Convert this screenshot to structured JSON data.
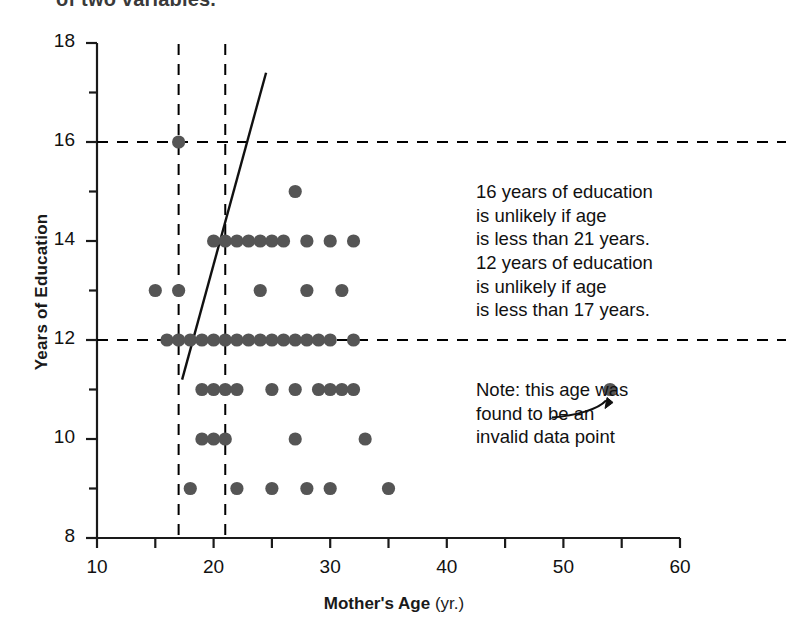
{
  "page": {
    "clipped_top_text": "of two variables."
  },
  "axes": {
    "ylabel": "Years of Education",
    "xlabel_bold": "Mother's Age",
    "xlabel_unit": "(yr.)",
    "x_ticks": [
      10,
      20,
      30,
      40,
      50,
      60
    ],
    "y_ticks": [
      8,
      10,
      12,
      14,
      16,
      18
    ],
    "x_minor_step": 5,
    "y_minor_step": 1
  },
  "annotations": {
    "stats": "16 years of education\nis unlikely if age\nis less than 21 years.\n12 years of education\nis unlikely if age\nis less than 17 years.",
    "note": "Note: this age was\nfound to be an\ninvalid data point"
  },
  "colors": {
    "dot": "#555555",
    "axis": "#1a1a1a",
    "guide": "#000000",
    "text": "#111111"
  },
  "chart_data": {
    "type": "scatter",
    "title": "",
    "xlabel": "Mother's Age (yr.)",
    "ylabel": "Years of Education",
    "xlim": [
      10,
      60
    ],
    "ylim": [
      8,
      18
    ],
    "grid": false,
    "legend": null,
    "points": [
      {
        "x": 17,
        "y": 16
      },
      {
        "x": 27,
        "y": 15
      },
      {
        "x": 20,
        "y": 14
      },
      {
        "x": 21,
        "y": 14
      },
      {
        "x": 22,
        "y": 14
      },
      {
        "x": 23,
        "y": 14
      },
      {
        "x": 24,
        "y": 14
      },
      {
        "x": 25,
        "y": 14
      },
      {
        "x": 26,
        "y": 14
      },
      {
        "x": 28,
        "y": 14
      },
      {
        "x": 30,
        "y": 14
      },
      {
        "x": 32,
        "y": 14
      },
      {
        "x": 15,
        "y": 13
      },
      {
        "x": 17,
        "y": 13
      },
      {
        "x": 24,
        "y": 13
      },
      {
        "x": 28,
        "y": 13
      },
      {
        "x": 31,
        "y": 13
      },
      {
        "x": 16,
        "y": 12
      },
      {
        "x": 17,
        "y": 12
      },
      {
        "x": 18,
        "y": 12
      },
      {
        "x": 19,
        "y": 12
      },
      {
        "x": 20,
        "y": 12
      },
      {
        "x": 21,
        "y": 12
      },
      {
        "x": 22,
        "y": 12
      },
      {
        "x": 23,
        "y": 12
      },
      {
        "x": 24,
        "y": 12
      },
      {
        "x": 25,
        "y": 12
      },
      {
        "x": 26,
        "y": 12
      },
      {
        "x": 27,
        "y": 12
      },
      {
        "x": 28,
        "y": 12
      },
      {
        "x": 29,
        "y": 12
      },
      {
        "x": 30,
        "y": 12
      },
      {
        "x": 32,
        "y": 12
      },
      {
        "x": 19,
        "y": 11
      },
      {
        "x": 20,
        "y": 11
      },
      {
        "x": 21,
        "y": 11
      },
      {
        "x": 22,
        "y": 11
      },
      {
        "x": 25,
        "y": 11
      },
      {
        "x": 27,
        "y": 11
      },
      {
        "x": 29,
        "y": 11
      },
      {
        "x": 30,
        "y": 11
      },
      {
        "x": 31,
        "y": 11
      },
      {
        "x": 32,
        "y": 11
      },
      {
        "x": 54,
        "y": 11
      },
      {
        "x": 19,
        "y": 10
      },
      {
        "x": 20,
        "y": 10
      },
      {
        "x": 21,
        "y": 10
      },
      {
        "x": 27,
        "y": 10
      },
      {
        "x": 33,
        "y": 10
      },
      {
        "x": 18,
        "y": 9
      },
      {
        "x": 22,
        "y": 9
      },
      {
        "x": 25,
        "y": 9
      },
      {
        "x": 28,
        "y": 9
      },
      {
        "x": 30,
        "y": 9
      },
      {
        "x": 35,
        "y": 9
      }
    ],
    "outlier": {
      "x": 54,
      "y": 11,
      "note": "invalid data point"
    },
    "regression_line": {
      "x0": 17.3,
      "y0": 11.2,
      "x1": 24.5,
      "y1": 17.4
    },
    "reference_lines": [
      {
        "orientation": "horizontal",
        "value": 16,
        "style": "dashed"
      },
      {
        "orientation": "horizontal",
        "value": 12,
        "style": "dashed"
      },
      {
        "orientation": "vertical",
        "value": 17,
        "style": "dashed"
      },
      {
        "orientation": "vertical",
        "value": 21,
        "style": "dashed"
      }
    ]
  }
}
